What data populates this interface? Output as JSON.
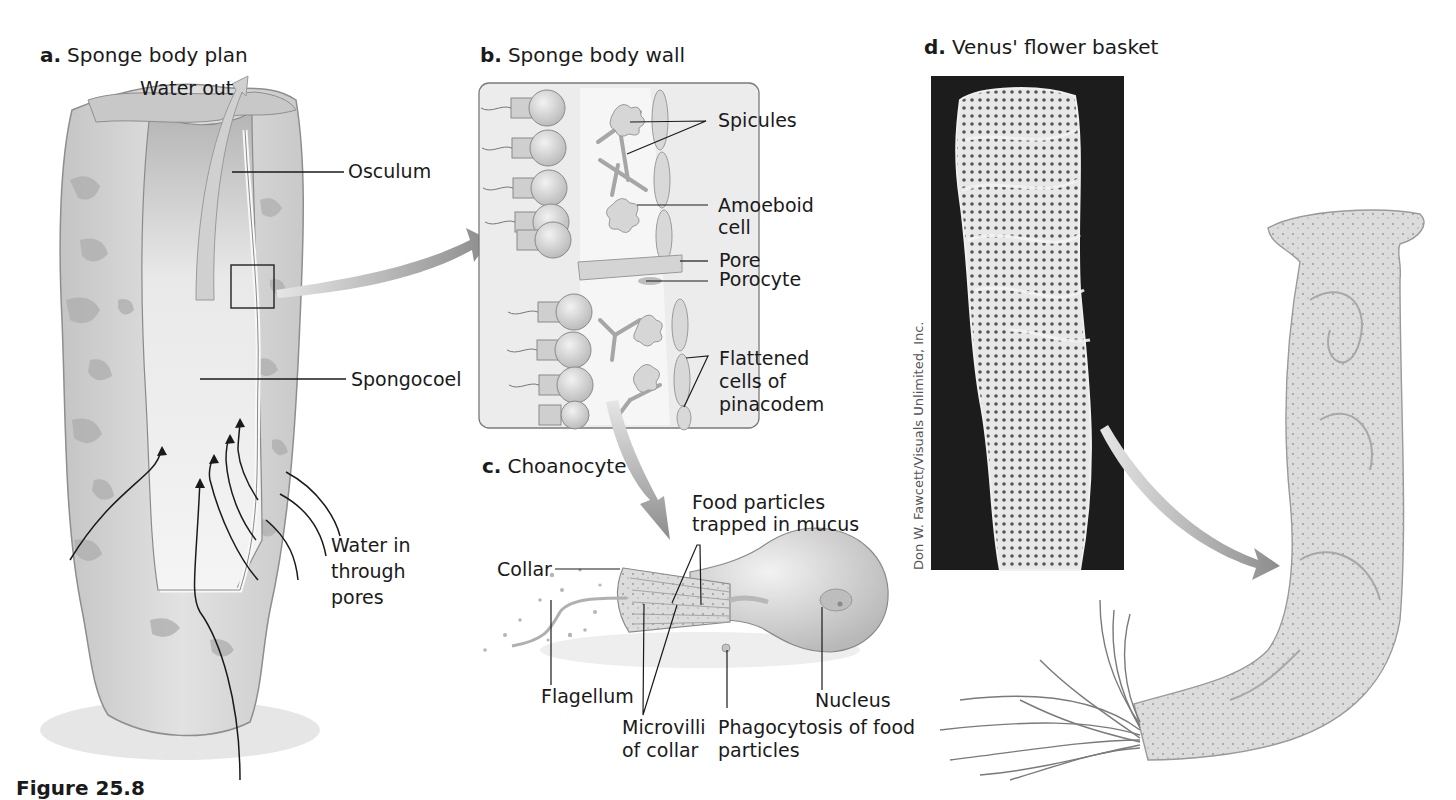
{
  "figure": {
    "caption": "Figure 25.8",
    "panels": [
      {
        "letter": "a.",
        "title": "Sponge body plan",
        "labels": {
          "water_out": "Water out",
          "osculum": "Osculum",
          "spongocoel": "Spongocoel",
          "water_in": "Water in\nthrough\npores"
        }
      },
      {
        "letter": "b.",
        "title": "Sponge body wall",
        "labels": {
          "spicules": "Spicules",
          "amoeboid_cell": "Amoeboid\ncell",
          "pore": "Pore",
          "porocyte": "Porocyte",
          "flattened_cells": "Flattened\ncells of\npinacodem"
        }
      },
      {
        "letter": "c.",
        "title": "Choanocyte",
        "labels": {
          "food_particles": "Food particles\ntrapped in mucus",
          "collar": "Collar",
          "flagellum": "Flagellum",
          "microvilli": "Microvilli\nof collar",
          "phagocytosis": "Phagocytosis of food\nparticles",
          "nucleus": "Nucleus"
        }
      },
      {
        "letter": "d.",
        "title": "Venus' flower basket",
        "photo_credit": "Don W. Fawcett/Visuals Unlimited, Inc."
      }
    ]
  },
  "colors": {
    "sponge_fill": "#d9d9d9",
    "sponge_shadow": "#a8a8a8",
    "arrow_gray": "#9a9a9a",
    "photo_bg": "#1c1c1c",
    "box_fill": "#ececec",
    "line": "#1a1a1a"
  }
}
